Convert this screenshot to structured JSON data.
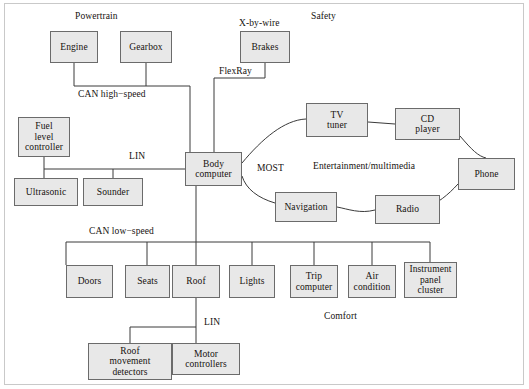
{
  "diagram": {
    "background_color": "#ffffff",
    "node_fill": "#e8e8e8",
    "node_stroke": "#6b6b6b",
    "frame_stroke": "#c9c9c9"
  },
  "group_labels": {
    "powertrain": "Powertrain",
    "x_by_wire": "X-by-wire",
    "safety": "Safety",
    "entertainment": "Entertainment/multimedia",
    "comfort": "Comfort"
  },
  "bus_labels": {
    "can_high_speed": "CAN high−speed",
    "can_low_speed": "CAN low−speed",
    "lin_body": "LIN",
    "lin_roof": "LIN",
    "flexray": "FlexRay",
    "most": "MOST"
  },
  "nodes": {
    "engine": "Engine",
    "gearbox": "Gearbox",
    "brakes": "Brakes",
    "fuel_level_controller_l1": "Fuel",
    "fuel_level_controller_l2": "level",
    "fuel_level_controller_l3": "controller",
    "ultrasonic": "Ultrasonic",
    "sounder": "Sounder",
    "body_computer_l1": "Body",
    "body_computer_l2": "computer",
    "tv_tuner_l1": "TV",
    "tv_tuner_l2": "tuner",
    "cd_player_l1": "CD",
    "cd_player_l2": "player",
    "phone": "Phone",
    "navigation": "Navigation",
    "radio": "Radio",
    "doors": "Doors",
    "seats": "Seats",
    "roof": "Roof",
    "lights": "Lights",
    "trip_computer_l1": "Trip",
    "trip_computer_l2": "computer",
    "air_condition_l1": "Air",
    "air_condition_l2": "condition",
    "instrument_panel_cluster_l1": "Instrument",
    "instrument_panel_cluster_l2": "panel",
    "instrument_panel_cluster_l3": "cluster",
    "roof_movement_detectors_l1": "Roof",
    "roof_movement_detectors_l2": "movement",
    "roof_movement_detectors_l3": "detectors",
    "motor_controllers_l1": "Motor",
    "motor_controllers_l2": "controllers"
  }
}
